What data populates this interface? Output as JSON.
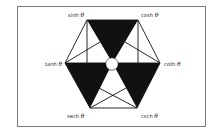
{
  "diagram": {
    "colors": {
      "background": "#ffffff",
      "frame": "#7a7a7a",
      "ink": "#111111",
      "label": "#2a2a2a"
    },
    "vertices": {
      "top_left": {
        "label": "sinh",
        "symbol": "θ"
      },
      "top_right": {
        "label": "cosh",
        "symbol": "θ"
      },
      "left": {
        "label": "tanh",
        "symbol": "θ"
      },
      "right": {
        "label": "coth",
        "symbol": "θ"
      },
      "bottom_left": {
        "label": "sech",
        "symbol": "θ"
      },
      "bottom_right": {
        "label": "csch",
        "symbol": "θ"
      }
    },
    "center": {
      "shape": "circle",
      "value": "1"
    },
    "shaded_triangles": [
      "top",
      "lower-left",
      "lower-right"
    ]
  }
}
